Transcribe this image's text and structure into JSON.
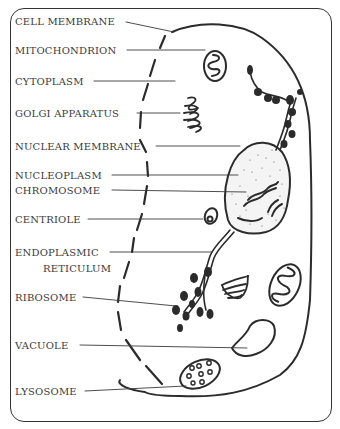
{
  "diagram": {
    "labels": [
      {
        "id": "cell-membrane",
        "text": "CELL MEMBRANE",
        "x": 15,
        "y": 11
      },
      {
        "id": "mitochondrion",
        "text": "MITOCHONDRION",
        "x": 15,
        "y": 44
      },
      {
        "id": "cytoplasm",
        "text": "CYTOPLASM",
        "x": 15,
        "y": 75
      },
      {
        "id": "golgi-apparatus",
        "text": "GOLGI APPARATUS",
        "x": 15,
        "y": 107
      },
      {
        "id": "nuclear-membrane",
        "text": "NUCLEAR MEMBRANE",
        "x": 15,
        "y": 140
      },
      {
        "id": "nucleoplasm",
        "text": "NUCLEOPLASM",
        "x": 15,
        "y": 170
      },
      {
        "id": "chromosome",
        "text": "CHROMOSOME",
        "x": 15,
        "y": 185
      },
      {
        "id": "centriole",
        "text": "CENTRIOLE",
        "x": 15,
        "y": 214
      },
      {
        "id": "endoplasmic-reticulum-1",
        "text": "ENDOPLASMIC",
        "x": 15,
        "y": 246
      },
      {
        "id": "endoplasmic-reticulum-2",
        "text": "RETICULUM",
        "x": 42,
        "y": 263
      },
      {
        "id": "ribosome",
        "text": "RIBOSOME",
        "x": 15,
        "y": 292
      },
      {
        "id": "vacuole",
        "text": "VACUOLE",
        "x": 15,
        "y": 340
      },
      {
        "id": "lysosome",
        "text": "LYSOSOME",
        "x": 15,
        "y": 385
      }
    ],
    "colors": {
      "ink": "#2b2b2b",
      "text": "#3a3a3a",
      "background": "#ffffff"
    }
  }
}
